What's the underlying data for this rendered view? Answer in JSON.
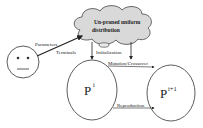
{
  "diagram": {
    "cloud": {
      "line1": "Un-praned uniform",
      "line2": "distribution"
    },
    "agent": {
      "icon": "neutral-face",
      "arrow_label_1": "Parameters",
      "arrow_label_2": "Terminals"
    },
    "edges": {
      "initialization": "Initialization",
      "mutation": "Mutation/Crossover",
      "reproduction": "Reproduction"
    },
    "nodes": {
      "left": {
        "base": "P",
        "sup": "i"
      },
      "right": {
        "base": "P",
        "sup": "i+1"
      }
    }
  }
}
